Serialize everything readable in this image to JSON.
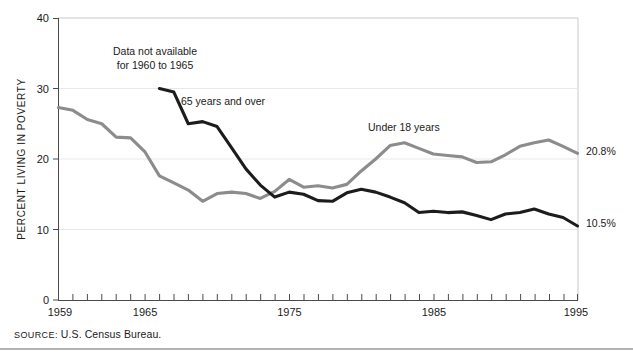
{
  "figure": {
    "source_prefix": "SOURCE:",
    "source_text": " U.S. Census Bureau."
  },
  "chart_data": {
    "type": "line",
    "title": "",
    "xlabel": "",
    "ylabel": "PERCENT LIVING IN POVERTY",
    "xlim": [
      1959,
      1995
    ],
    "ylim": [
      0,
      40
    ],
    "grid": "horizontal",
    "legend": "inline-annotations",
    "ytick_labels": [
      "0",
      "10",
      "20",
      "30",
      "40"
    ],
    "ytick_values": [
      0,
      10,
      20,
      30,
      40
    ],
    "xtick_labels": [
      "1959",
      "1965",
      "1975",
      "1985",
      "1995"
    ],
    "xtick_values": [
      1959,
      1965,
      1975,
      1985,
      1995
    ],
    "minor_xticks_every": 1,
    "annotations": [
      {
        "name": "data-gap-note",
        "text_line1": "Data not available",
        "text_line2": "for 1960 to 1965",
        "x": 1967.4,
        "y": 36.5
      },
      {
        "name": "series-label-65plus",
        "text": "65 years and over",
        "x": 1971.0,
        "y": 28.6
      },
      {
        "name": "series-label-under18",
        "text": "Under 18 years",
        "x": 1985.2,
        "y": 25.3
      }
    ],
    "end_labels": [
      {
        "name": "end-label-under18",
        "text": "20.8%",
        "value": 20.8,
        "year": 1995
      },
      {
        "name": "end-label-65plus",
        "text": "10.5%",
        "value": 10.5,
        "year": 1995
      }
    ],
    "colors": {
      "under18": "#8c8c8c",
      "65plus": "#1c1c1c",
      "gridline": "#e8e8e8",
      "frame": "#c9c9c9",
      "axis": "#4a4a4a",
      "text": "#1a1a1a"
    },
    "x": [
      1959,
      1960,
      1961,
      1962,
      1963,
      1964,
      1965,
      1966,
      1967,
      1968,
      1969,
      1970,
      1971,
      1972,
      1973,
      1974,
      1975,
      1976,
      1977,
      1978,
      1979,
      1980,
      1981,
      1982,
      1983,
      1984,
      1985,
      1986,
      1987,
      1988,
      1989,
      1990,
      1991,
      1992,
      1993,
      1994,
      1995
    ],
    "series": [
      {
        "name": "Under 18 years",
        "color": "#8c8c8c",
        "gap": false,
        "values": [
          27.3,
          26.9,
          25.6,
          25.0,
          23.1,
          23.0,
          21.0,
          17.6,
          16.6,
          15.6,
          14.0,
          15.1,
          15.3,
          15.1,
          14.4,
          15.4,
          17.1,
          16.0,
          16.2,
          15.9,
          16.4,
          18.3,
          20.0,
          21.9,
          22.3,
          21.5,
          20.7,
          20.5,
          20.3,
          19.5,
          19.6,
          20.6,
          21.8,
          22.3,
          22.7,
          21.8,
          20.8
        ]
      },
      {
        "name": "65 years and over",
        "color": "#1c1c1c",
        "gap_years": [
          1960,
          1961,
          1962,
          1963,
          1964,
          1965
        ],
        "values": [
          35.2,
          34.0,
          32.6,
          31.3,
          30.0,
          28.8,
          28.5,
          30.0,
          29.5,
          25.0,
          25.3,
          24.6,
          21.6,
          18.6,
          16.3,
          14.6,
          15.3,
          15.0,
          14.1,
          14.0,
          15.2,
          15.7,
          15.3,
          14.6,
          13.8,
          12.4,
          12.6,
          12.4,
          12.5,
          12.0,
          11.4,
          12.2,
          12.4,
          12.9,
          12.2,
          11.7,
          10.5
        ]
      }
    ]
  }
}
